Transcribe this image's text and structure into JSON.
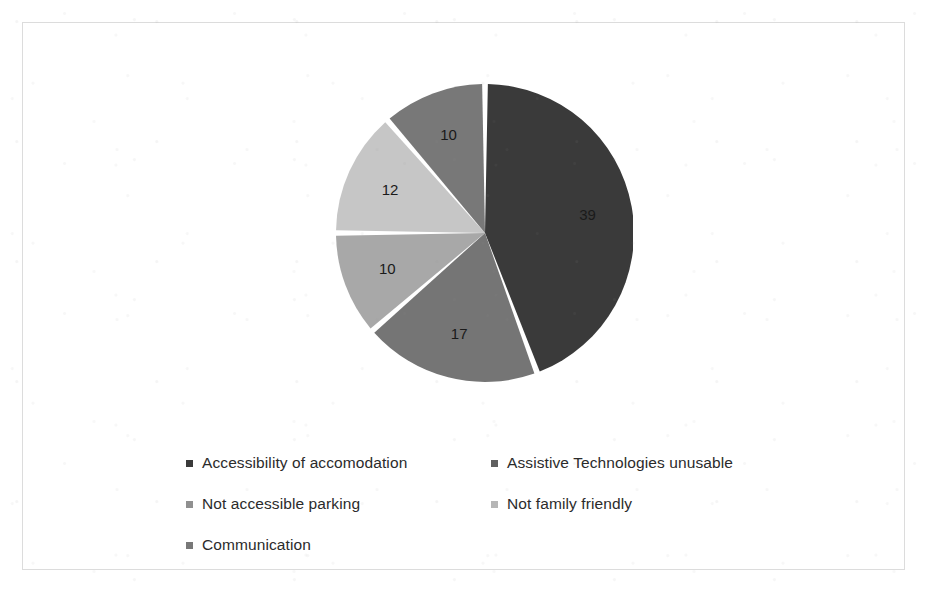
{
  "chart_data": {
    "type": "pie",
    "title": "",
    "subtitle": "",
    "xlabel": "",
    "ylabel": "",
    "grid": false,
    "legend_position": "bottom",
    "start_angle_deg": 0,
    "direction": "clockwise",
    "total": 88,
    "categories": [
      "Accessibility of accomodation",
      "Assistive Technologies unusable",
      "Not accessible parking",
      "Not family friendly",
      "Communication"
    ],
    "values": [
      39,
      17,
      10,
      12,
      10
    ],
    "data_labels": [
      "39",
      "17",
      "10",
      "12",
      "10"
    ],
    "colors": [
      "#3a3a3a",
      "#757575",
      "#a8a8a8",
      "#c6c6c6",
      "#787878"
    ],
    "slices": [
      {
        "label": "Accessibility of accomodation",
        "value": 39,
        "data_label": "39",
        "color": "#3a3a3a"
      },
      {
        "label": "Assistive Technologies unusable",
        "value": 17,
        "data_label": "17",
        "color": "#757575"
      },
      {
        "label": "Not accessible parking",
        "value": 10,
        "data_label": "10",
        "color": "#a8a8a8"
      },
      {
        "label": "Not family friendly",
        "value": 12,
        "data_label": "12",
        "color": "#c6c6c6"
      },
      {
        "label": "Communication",
        "value": 10,
        "data_label": "10",
        "color": "#787878"
      }
    ]
  },
  "legend": {
    "rows": [
      [
        {
          "label": "Accessibility of accomodation",
          "color": "#3a3a3a"
        },
        {
          "label": "Assistive Technologies unusable",
          "color": "#606060"
        }
      ],
      [
        {
          "label": "Not accessible parking",
          "color": "#909090"
        },
        {
          "label": "Not family friendly",
          "color": "#b6b6b6"
        }
      ],
      [
        {
          "label": "Communication",
          "color": "#787878"
        },
        {
          "label": "",
          "color": "transparent"
        }
      ]
    ]
  },
  "frame": {
    "border_color": "#dcdcdc",
    "background": "#ffffff"
  }
}
